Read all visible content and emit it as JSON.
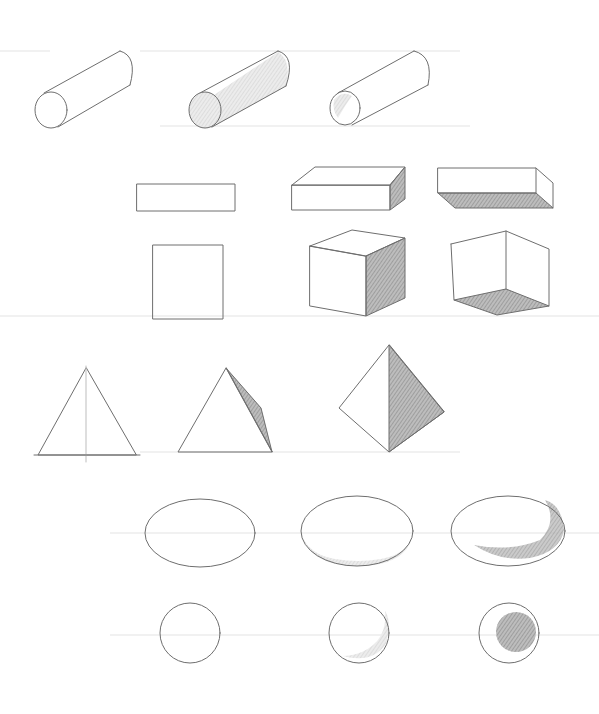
{
  "colors": {
    "paper": "#ffffff",
    "pencil_line": "#6e6e6e",
    "shade_dark": "#8a8a8a",
    "shade_light": "#cfcfcf",
    "guide_line": "#e3e3e3"
  },
  "rows": [
    {
      "name": "cylinders",
      "items": [
        {
          "shape": "cylinder",
          "style": "outline"
        },
        {
          "shape": "cylinder",
          "style": "shaded-side-and-end"
        },
        {
          "shape": "cylinder",
          "style": "hollow-open-end"
        }
      ]
    },
    {
      "name": "rectangular-boxes",
      "items": [
        {
          "shape": "rectangle",
          "style": "flat-front-view"
        },
        {
          "shape": "box",
          "style": "shaded-right-side"
        },
        {
          "shape": "box",
          "style": "shaded-bottom-face"
        }
      ]
    },
    {
      "name": "cubes",
      "items": [
        {
          "shape": "square",
          "style": "flat-front-view"
        },
        {
          "shape": "cube",
          "style": "shaded-right-side"
        },
        {
          "shape": "cube",
          "style": "shaded-bottom-face"
        }
      ]
    },
    {
      "name": "pyramids",
      "items": [
        {
          "shape": "triangle",
          "style": "flat-with-center-guide"
        },
        {
          "shape": "pyramid",
          "style": "shaded-right-face"
        },
        {
          "shape": "tetrahedron",
          "style": "shaded-right-face"
        }
      ]
    },
    {
      "name": "ellipses",
      "items": [
        {
          "shape": "ellipse",
          "style": "outline"
        },
        {
          "shape": "disc",
          "style": "shaded-rim"
        },
        {
          "shape": "ellipsoid",
          "style": "crescent-shadow"
        }
      ]
    },
    {
      "name": "spheres",
      "items": [
        {
          "shape": "circle",
          "style": "outline"
        },
        {
          "shape": "sphere",
          "style": "crescent-shadow"
        },
        {
          "shape": "sphere",
          "style": "inner-shaded-circle"
        }
      ]
    }
  ]
}
